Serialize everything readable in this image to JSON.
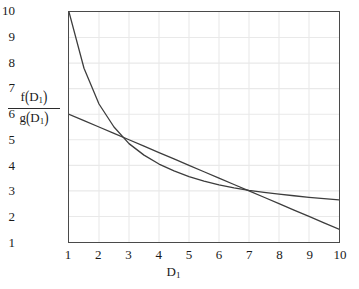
{
  "chart_data": {
    "type": "line",
    "title": "",
    "subtitle": "",
    "xlabel": "D_1",
    "ylabel": "f(D_1) / g(D_1)",
    "xlabel_display": "D",
    "xlabel_sub": "1",
    "ylabel_numerator": "f",
    "ylabel_numerator_arg": "D",
    "ylabel_numerator_sub": "1",
    "ylabel_denominator": "g",
    "ylabel_denominator_arg": "D",
    "ylabel_denominator_sub": "1",
    "xlim": [
      1,
      10
    ],
    "ylim": [
      1,
      10
    ],
    "xticks": [
      "1",
      "2",
      "3",
      "4",
      "5",
      "6",
      "7",
      "8",
      "9",
      "10"
    ],
    "yticks": [
      "1",
      "2",
      "3",
      "4",
      "5",
      "6",
      "7",
      "8",
      "9",
      "10"
    ],
    "grid": true,
    "legend": "none",
    "x": [
      1,
      1.5,
      2,
      2.5,
      3,
      3.5,
      4,
      4.5,
      5,
      5.5,
      6,
      6.5,
      7,
      7.5,
      8,
      8.5,
      9,
      9.5,
      10
    ],
    "series": [
      {
        "name": "f(D_1)",
        "style": "curve",
        "color": "#3d3d3d",
        "values": [
          10,
          7.8,
          6.4,
          5.5,
          4.85,
          4.4,
          4.05,
          3.78,
          3.56,
          3.38,
          3.24,
          3.12,
          3.02,
          2.94,
          2.87,
          2.81,
          2.75,
          2.7,
          2.65
        ]
      },
      {
        "name": "g(D_1)",
        "style": "line",
        "color": "#3d3d3d",
        "values": [
          6,
          5.75,
          5.5,
          5.25,
          5.0,
          4.75,
          4.5,
          4.25,
          4.0,
          3.75,
          3.5,
          3.25,
          3.0,
          2.75,
          2.5,
          2.25,
          2.0,
          1.75,
          1.5
        ]
      }
    ],
    "colors": {
      "frame": "#4a4a4a",
      "grid": "#e9e9e9",
      "curve": "#3d3d3d",
      "text": "#1a1a1a",
      "background": "#ffffff"
    }
  }
}
